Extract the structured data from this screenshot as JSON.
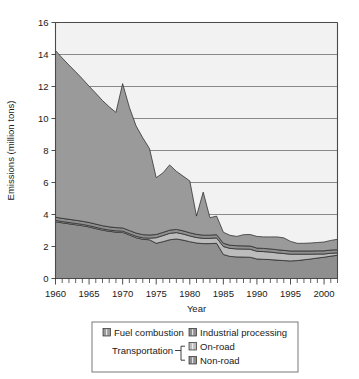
{
  "chart_data": {
    "type": "area",
    "stacked": true,
    "title": "",
    "subtitle": "",
    "xlabel": "Year",
    "ylabel": "Emissions (million tons)",
    "xlim": [
      1960,
      2002
    ],
    "ylim": [
      0,
      16
    ],
    "grid": true,
    "grid_axis": "y",
    "legend_position": "bottom",
    "x_tick_labels": [
      "1960",
      "1965",
      "1970",
      "1975",
      "1980",
      "1985",
      "1990",
      "1995",
      "2000"
    ],
    "x_tick_values": [
      1960,
      1965,
      1970,
      1975,
      1980,
      1985,
      1990,
      1995,
      2000
    ],
    "x_minor_tick_step": 1,
    "y_tick_labels": [
      "0",
      "2",
      "4",
      "6",
      "8",
      "10",
      "12",
      "14",
      "16"
    ],
    "y_tick_values": [
      0,
      2,
      4,
      6,
      8,
      10,
      12,
      14,
      16
    ],
    "x": [
      1960,
      1961,
      1962,
      1963,
      1964,
      1965,
      1966,
      1967,
      1968,
      1969,
      1970,
      1971,
      1972,
      1973,
      1974,
      1975,
      1976,
      1977,
      1978,
      1979,
      1980,
      1981,
      1982,
      1983,
      1984,
      1985,
      1986,
      1987,
      1988,
      1989,
      1990,
      1991,
      1992,
      1993,
      1994,
      1995,
      1996,
      1997,
      1998,
      1999,
      2000,
      2001,
      2002
    ],
    "series": [
      {
        "name": "Non-road",
        "color": "#8f8f8f",
        "values": [
          3.55,
          3.48,
          3.42,
          3.36,
          3.3,
          3.22,
          3.12,
          3.02,
          2.95,
          2.9,
          2.88,
          2.72,
          2.55,
          2.45,
          2.42,
          2.2,
          2.3,
          2.42,
          2.47,
          2.4,
          2.3,
          2.22,
          2.18,
          2.18,
          2.2,
          1.5,
          1.38,
          1.35,
          1.34,
          1.33,
          1.22,
          1.2,
          1.18,
          1.15,
          1.12,
          1.1,
          1.12,
          1.17,
          1.22,
          1.28,
          1.33,
          1.4,
          1.45
        ]
      },
      {
        "name": "On-road",
        "color": "#bcbcbc",
        "values": [
          0.08,
          0.08,
          0.08,
          0.08,
          0.08,
          0.08,
          0.08,
          0.08,
          0.08,
          0.08,
          0.08,
          0.08,
          0.09,
          0.09,
          0.1,
          0.35,
          0.38,
          0.4,
          0.4,
          0.38,
          0.36,
          0.34,
          0.33,
          0.33,
          0.34,
          0.5,
          0.5,
          0.5,
          0.5,
          0.5,
          0.48,
          0.48,
          0.47,
          0.45,
          0.44,
          0.42,
          0.4,
          0.35,
          0.3,
          0.25,
          0.2,
          0.18,
          0.15
        ]
      },
      {
        "name": "Industrial processing",
        "color": "#8f8f8f",
        "values": [
          0.2,
          0.2,
          0.2,
          0.2,
          0.2,
          0.2,
          0.2,
          0.2,
          0.2,
          0.2,
          0.2,
          0.2,
          0.2,
          0.2,
          0.2,
          0.2,
          0.2,
          0.2,
          0.2,
          0.2,
          0.2,
          0.2,
          0.2,
          0.2,
          0.2,
          0.2,
          0.2,
          0.2,
          0.2,
          0.2,
          0.2,
          0.2,
          0.2,
          0.2,
          0.2,
          0.2,
          0.2,
          0.2,
          0.2,
          0.2,
          0.2,
          0.2,
          0.2
        ]
      },
      {
        "name": "Fuel combustion",
        "color": "#9a9a9a",
        "values": [
          10.42,
          10.02,
          9.64,
          9.28,
          8.9,
          8.52,
          8.18,
          7.82,
          7.5,
          7.2,
          9.02,
          7.7,
          6.7,
          6.05,
          5.4,
          3.55,
          3.72,
          4.08,
          3.63,
          3.42,
          3.24,
          1.14,
          2.69,
          1.09,
          1.16,
          0.69,
          0.62,
          0.58,
          0.7,
          0.72,
          0.73,
          0.72,
          0.75,
          0.8,
          0.78,
          0.6,
          0.48,
          0.48,
          0.5,
          0.52,
          0.55,
          0.6,
          0.65
        ]
      }
    ],
    "totals": [
      14.25,
      13.78,
      13.34,
      12.92,
      12.48,
      12.02,
      11.58,
      11.12,
      10.73,
      10.38,
      12.18,
      10.7,
      9.54,
      8.79,
      8.12,
      6.3,
      6.6,
      7.1,
      6.7,
      6.4,
      6.1,
      3.9,
      5.4,
      3.8,
      3.9,
      2.89,
      2.7,
      2.63,
      2.74,
      2.75,
      2.63,
      2.6,
      2.6,
      2.6,
      2.54,
      2.32,
      2.2,
      2.2,
      2.22,
      2.25,
      2.28,
      2.38,
      2.45
    ]
  },
  "legend": {
    "entries": [
      {
        "label": "Fuel combustion",
        "color": "#9a9a9a",
        "swatch": "legend-swatch-fuel"
      },
      {
        "label": "Industrial processing",
        "color": "#8f8f8f",
        "swatch": "legend-swatch-industrial"
      },
      {
        "label": "On-road",
        "color": "#bcbcbc",
        "swatch": "legend-swatch-onroad"
      },
      {
        "label": "Non-road",
        "color": "#8f8f8f",
        "swatch": "legend-swatch-nonroad"
      }
    ],
    "group_label": "Transportation"
  },
  "colors": {
    "fuel_combustion": "#9a9a9a",
    "industrial_processing": "#8f8f8f",
    "on_road": "#bcbcbc",
    "non_road": "#8f8f8f",
    "plot_background": "#f2f2f2",
    "grid": "#6e6e6e",
    "axis": "#4a4a4a",
    "text": "#1a1a1a"
  }
}
